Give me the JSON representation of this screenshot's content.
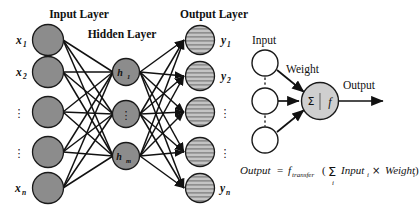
{
  "figure": {
    "background_color": "#ffffff",
    "line_color": "#111111",
    "node_fill_input": "#8c8c8c",
    "node_fill_hidden": "#8c8c8c",
    "node_fill_output": "#b8b8b8",
    "node_fill_white": "#ffffff",
    "node_fill_neuron": "#cfcfcf",
    "node_stroke": "#1a1a1a"
  },
  "network": {
    "layer_labels": {
      "input": "Input Layer",
      "hidden": "Hidden Layer",
      "output": "Output Layer"
    },
    "input_nodes": [
      {
        "label": "x",
        "sub": "1",
        "cx": 48,
        "cy": 40,
        "r": 15.5
      },
      {
        "label": "x",
        "sub": "2",
        "cx": 48,
        "cy": 72,
        "r": 15.5
      },
      {
        "label": "⋮",
        "sub": "",
        "cx": 48,
        "cy": 112,
        "r": 15.5
      },
      {
        "label": "⋮",
        "sub": "",
        "cx": 48,
        "cy": 152,
        "r": 15.5
      },
      {
        "label": "x",
        "sub": "n",
        "cx": 48,
        "cy": 188,
        "r": 15.5
      }
    ],
    "hidden_nodes": [
      {
        "label": "h",
        "sub": "1",
        "cx": 126,
        "cy": 72,
        "r": 13.5
      },
      {
        "label": "",
        "sub": "",
        "dots": "⋮",
        "cx": 126,
        "cy": 114,
        "r": 13.5
      },
      {
        "label": "h",
        "sub": "m",
        "cx": 126,
        "cy": 156,
        "r": 13.5
      }
    ],
    "output_nodes": [
      {
        "label": "y",
        "sub": "1",
        "cx": 200,
        "cy": 40,
        "r": 14.5
      },
      {
        "label": "y",
        "sub": "2",
        "cx": 200,
        "cy": 76,
        "r": 14.5
      },
      {
        "label": "⋮",
        "sub": "",
        "cx": 200,
        "cy": 112,
        "r": 14.5
      },
      {
        "label": "⋮",
        "sub": "",
        "cx": 200,
        "cy": 152,
        "r": 14.5
      },
      {
        "label": "y",
        "sub": "n",
        "cx": 200,
        "cy": 188,
        "r": 14.5
      }
    ]
  },
  "neuron_detail": {
    "input_label": "Input",
    "weight_label": "Weight",
    "output_label": "Output",
    "sum_symbol": "Σ",
    "transfer_symbol": "f",
    "input_nodes": [
      {
        "cx": 265,
        "cy": 63,
        "r": 13
      },
      {
        "cx": 265,
        "cy": 101,
        "r": 13
      },
      {
        "cx": 265,
        "cy": 140,
        "r": 13
      }
    ],
    "neuron": {
      "cx": 320,
      "cy": 101,
      "r": 18.5
    },
    "vertical_dots": "⋮"
  },
  "equation": {
    "lhs": "Output",
    "equals": "=",
    "transfer_fn": "f",
    "transfer_sub": "transfer",
    "open_paren": "(",
    "sigma": "Σ",
    "sigma_index": "i",
    "input_term": "Input",
    "input_sub": "i",
    "times": "×",
    "weight_term": "Weight",
    "weight_sub": "i",
    "close_paren": ")"
  }
}
